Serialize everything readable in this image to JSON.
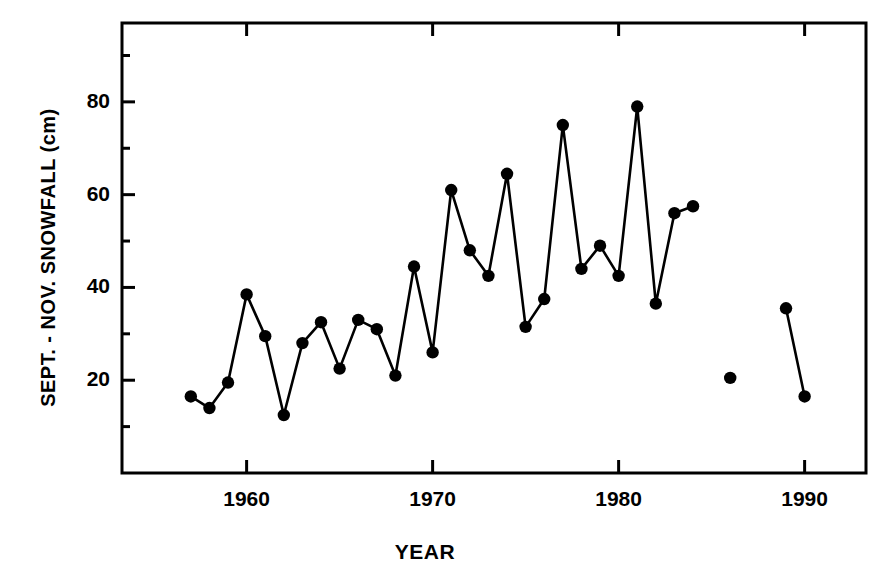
{
  "chart_data": {
    "type": "line",
    "title": "",
    "subtitle": "",
    "xlabel": "YEAR",
    "ylabel": "SEPT. - NOV. SNOWFALL (cm)",
    "xlim": [
      1953.3,
      1993.3
    ],
    "ylim": [
      0,
      97
    ],
    "xticks": [
      1960,
      1970,
      1980,
      1990
    ],
    "xtick_labels": [
      "1960",
      "1970",
      "1980",
      "1990"
    ],
    "yticks": [
      20,
      40,
      60,
      80
    ],
    "ytick_labels": [
      "20",
      "40",
      "60",
      "80"
    ],
    "minor_yticks": [
      10,
      30,
      50,
      70,
      90
    ],
    "minor_xticks": [],
    "grid": false,
    "legend": null,
    "marker": "filled-circle",
    "line_color": "#000000",
    "marker_color": "#000000",
    "background_color": "#ffffff",
    "frame": "box",
    "x": [
      1957,
      1958,
      1959,
      1960,
      1961,
      1962,
      1963,
      1964,
      1965,
      1966,
      1967,
      1968,
      1969,
      1970,
      1971,
      1972,
      1973,
      1974,
      1975,
      1976,
      1977,
      1978,
      1979,
      1980,
      1981,
      1982,
      1983,
      1984,
      1986,
      1989,
      1990
    ],
    "values": [
      16.5,
      14.0,
      19.5,
      38.5,
      29.5,
      12.5,
      28.0,
      32.5,
      22.5,
      33.0,
      31.0,
      21.0,
      44.5,
      26.0,
      61.0,
      48.0,
      42.5,
      64.5,
      31.5,
      37.5,
      75.0,
      44.0,
      49.0,
      42.5,
      79.0,
      36.5,
      56.0,
      57.5,
      20.5,
      35.5,
      16.5
    ],
    "segments": [
      {
        "x": [
          1957,
          1958,
          1959,
          1960,
          1961,
          1962,
          1963,
          1964,
          1965,
          1966,
          1967,
          1968,
          1969,
          1970,
          1971,
          1972,
          1973,
          1974,
          1975,
          1976,
          1977,
          1978,
          1979,
          1980,
          1981,
          1982,
          1983,
          1984
        ],
        "values": [
          16.5,
          14.0,
          19.5,
          38.5,
          29.5,
          12.5,
          28.0,
          32.5,
          22.5,
          33.0,
          31.0,
          21.0,
          44.5,
          26.0,
          61.0,
          48.0,
          42.5,
          64.5,
          31.5,
          37.5,
          75.0,
          44.0,
          49.0,
          42.5,
          79.0,
          36.5,
          56.0,
          57.5
        ]
      },
      {
        "x": [
          1986
        ],
        "values": [
          20.5
        ]
      },
      {
        "x": [
          1989,
          1990
        ],
        "values": [
          35.5,
          16.5
        ]
      }
    ]
  },
  "figure": {
    "ylabel": "SEPT. - NOV. SNOWFALL (cm)",
    "xlabel": "YEAR"
  }
}
